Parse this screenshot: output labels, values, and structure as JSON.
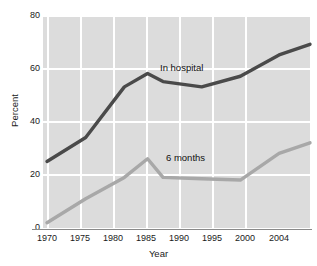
{
  "chart_data": {
    "type": "line",
    "title": "",
    "xlabel": "Year",
    "ylabel": "Percent",
    "xlim": [
      1970,
      2004
    ],
    "ylim": [
      0,
      80
    ],
    "grid": true,
    "legend_position": "inline-annotations",
    "x_ticks": [
      "1970",
      "1975",
      "1980",
      "1985",
      "1990",
      "1995",
      "2000",
      "2004"
    ],
    "y_ticks": [
      "0",
      "20",
      "40",
      "60",
      "80"
    ],
    "x": [
      1970,
      1975,
      1980,
      1983,
      1985,
      1990,
      1995,
      2000,
      2004
    ],
    "series": [
      {
        "name": "In hospital",
        "color": "#4a4a4a",
        "values": [
          25,
          34,
          53,
          58,
          55,
          53,
          57,
          65,
          69
        ]
      },
      {
        "name": "6 months",
        "color": "#a8a8a8",
        "values": [
          2,
          11,
          19,
          26,
          19,
          18.5,
          18,
          28,
          32
        ]
      }
    ],
    "annotations": [
      {
        "text": "In hospital",
        "series": "In hospital"
      },
      {
        "text": "6 months",
        "series": "6 months"
      }
    ],
    "colors": {
      "plot_background": "#dcdcdc",
      "gridline": "#ffffff",
      "axis": "#8a8a8a",
      "text": "#1a1a1a"
    }
  }
}
